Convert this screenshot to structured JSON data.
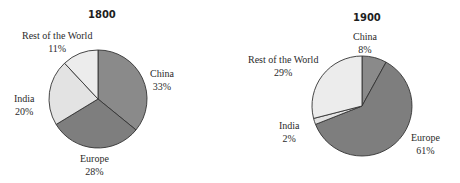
{
  "chart_data": [
    {
      "type": "pie",
      "title": "1800",
      "categories": [
        "China",
        "Europe",
        "India",
        "Rest of the World"
      ],
      "values": [
        33,
        28,
        20,
        11
      ],
      "labels": [
        "China 33%",
        "Europe 28%",
        "India 20%",
        "Rest of the World 11%"
      ],
      "colors": [
        "#8a8a8a",
        "#7e7e7e",
        "#e3e3e3",
        "#ececec"
      ],
      "start_angle": "12 o'clock, clockwise"
    },
    {
      "type": "pie",
      "title": "1900",
      "categories": [
        "China",
        "Europe",
        "India",
        "Rest of the World"
      ],
      "values": [
        8,
        61,
        2,
        29
      ],
      "labels": [
        "China 8%",
        "Europe 61%",
        "India 2%",
        "Rest of the World 29%"
      ],
      "colors": [
        "#8a8a8a",
        "#7e7e7e",
        "#e3e3e3",
        "#ececec"
      ],
      "start_angle": "12 o'clock, clockwise"
    }
  ],
  "charts": [
    {
      "title": "1800",
      "slices": {
        "china": {
          "name": "China",
          "pct": "33%"
        },
        "europe": {
          "name": "Europe",
          "pct": "28%"
        },
        "india": {
          "name": "India",
          "pct": "20%"
        },
        "rest": {
          "name": "Rest of the World",
          "pct": "11%"
        }
      }
    },
    {
      "title": "1900",
      "slices": {
        "china": {
          "name": "China",
          "pct": "8%"
        },
        "europe": {
          "name": "Europe",
          "pct": "61%"
        },
        "india": {
          "name": "India",
          "pct": "2%"
        },
        "rest": {
          "name": "Rest of the World",
          "pct": "29%"
        }
      }
    }
  ]
}
